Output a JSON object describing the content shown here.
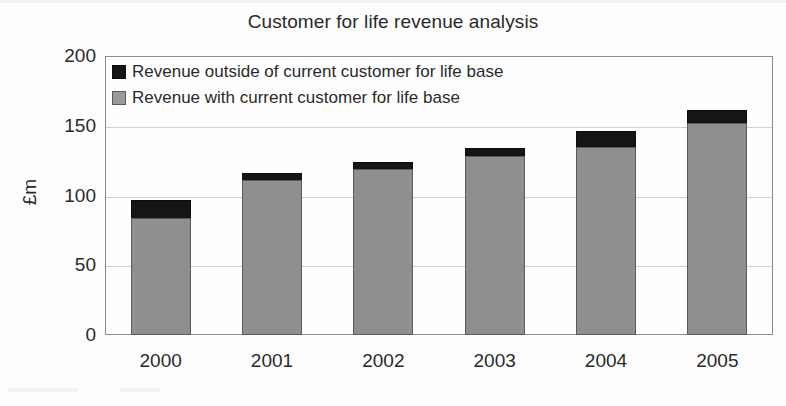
{
  "chart_data": {
    "type": "bar",
    "subtype": "stacked-column",
    "title": "Customer for life revenue analysis",
    "xlabel": "",
    "ylabel": "£m",
    "categories": [
      "2000",
      "2001",
      "2002",
      "2003",
      "2004",
      "2005"
    ],
    "series": [
      {
        "name": "Revenue with current customer for life base",
        "color": "#8f8f8f",
        "values": [
          84,
          111,
          119,
          128,
          135,
          152
        ]
      },
      {
        "name": "Revenue outside of current customer for life base",
        "color": "#151515",
        "values": [
          13,
          5,
          5,
          6,
          11,
          9
        ]
      }
    ],
    "totals": [
      97,
      116,
      124,
      134,
      146,
      161
    ],
    "ylim": [
      0,
      200
    ],
    "yticks": [
      0,
      50,
      100,
      150,
      200
    ],
    "ytick_labels": [
      "0",
      "50",
      "100",
      "150",
      "200"
    ],
    "grid": true,
    "grid_axis": "y",
    "legend_position": "top-left-inside",
    "legend_order": [
      "Revenue outside of current customer for life base",
      "Revenue with current customer for life base"
    ]
  },
  "legend": {
    "items": [
      {
        "label": "Revenue outside of current customer for life base",
        "swatch": "black-swatch-icon"
      },
      {
        "label": "Revenue with current customer for life base",
        "swatch": "grey-swatch-icon"
      }
    ]
  },
  "colors": {
    "series_black": "#151515",
    "series_grey": "#8f8f8f",
    "gridline": "#cfcfcf",
    "frame": "#8c8c8c",
    "text": "#2a2a2a",
    "background": "#fdfdfd"
  }
}
